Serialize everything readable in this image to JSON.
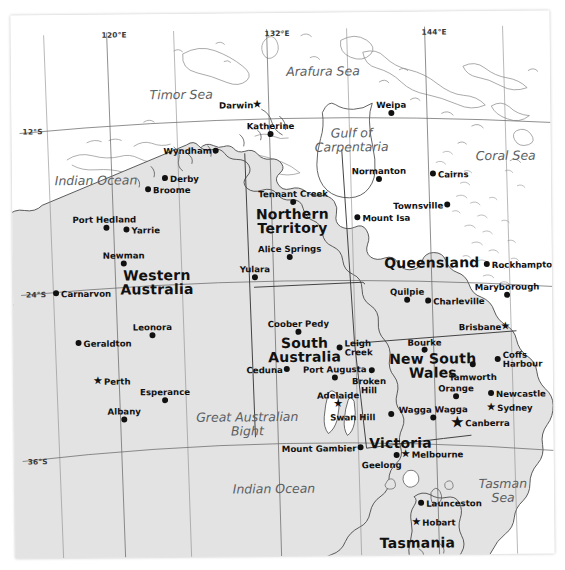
{
  "map": {
    "title": "Australia reference map",
    "projection_note": "tilted paper scan",
    "colors": {
      "land": "#e2e2e2",
      "land_stroke": "#4a4a4a",
      "ocean": "#ffffff",
      "graticule": "#5a5a5a",
      "border": "#333333",
      "label": "#111111",
      "water_label": "#5b5f63"
    },
    "graticule_labels": [
      {
        "name": "meridian-120E",
        "text": "120°E",
        "x": 104,
        "y": 30
      },
      {
        "name": "meridian-132E",
        "text": "132°E",
        "x": 267,
        "y": 30
      },
      {
        "name": "meridian-144E",
        "text": "144°E",
        "x": 424,
        "y": 30
      },
      {
        "name": "parallel-12S",
        "text": "12°S",
        "x": 24,
        "y": 126
      },
      {
        "name": "parallel-24S",
        "text": "24°S",
        "x": 26,
        "y": 289
      },
      {
        "name": "parallel-36S",
        "text": "36°S",
        "x": 26,
        "y": 456
      }
    ],
    "states": [
      {
        "name": "western-australia",
        "lines": [
          "Western",
          "Australia"
        ],
        "x": 156,
        "y": 271
      },
      {
        "name": "northern-territory",
        "lines": [
          "Northern",
          "Territory"
        ],
        "x": 292,
        "y": 211
      },
      {
        "name": "south-australia",
        "lines": [
          "South",
          "Australia"
        ],
        "x": 303,
        "y": 340
      },
      {
        "name": "queensland",
        "lines": [
          "Queensland"
        ],
        "x": 431,
        "y": 258
      },
      {
        "name": "new-south-wales",
        "lines": [
          "New South",
          "Wales"
        ],
        "x": 431,
        "y": 357
      },
      {
        "name": "victoria",
        "lines": [
          "Victoria"
        ],
        "x": 398,
        "y": 437
      },
      {
        "name": "tasmania",
        "lines": [
          "Tasmania"
        ],
        "x": 414,
        "y": 537
      }
    ],
    "water_bodies": [
      {
        "name": "timor-sea",
        "lines": [
          "Timor Sea"
        ],
        "x": 182,
        "y": 86,
        "size": "big"
      },
      {
        "name": "arafura-sea",
        "lines": [
          "Arafura Sea"
        ],
        "x": 324,
        "y": 64,
        "size": "big"
      },
      {
        "name": "gulf-of-carpentaria",
        "lines": [
          "Gulf of",
          "Carpentaria"
        ],
        "x": 352,
        "y": 125,
        "size": "big"
      },
      {
        "name": "coral-sea",
        "lines": [
          "Coral Sea"
        ],
        "x": 506,
        "y": 150,
        "size": "big"
      },
      {
        "name": "indian-ocean-north",
        "lines": [
          "Indian Ocean"
        ],
        "x": 96,
        "y": 171,
        "size": "big"
      },
      {
        "name": "great-australian-bight",
        "lines": [
          "Great Australian",
          "Bight"
        ],
        "x": 245,
        "y": 408,
        "size": "big"
      },
      {
        "name": "indian-ocean-south",
        "lines": [
          "Indian Ocean"
        ],
        "x": 271,
        "y": 481,
        "size": "big"
      },
      {
        "name": "tasman-sea",
        "lines": [
          "Tasman",
          "Sea"
        ],
        "x": 500,
        "y": 477,
        "size": "big"
      }
    ],
    "cities": [
      {
        "name": "darwin",
        "label": "Darwin",
        "marker": "star",
        "mx": 259,
        "my": 104,
        "lx": 255,
        "ly": 101,
        "anchor": "right"
      },
      {
        "name": "katherine",
        "label": "Katherine",
        "marker": "dot",
        "mx": 272,
        "my": 134,
        "lx": 272,
        "ly": 122,
        "anchor": "center"
      },
      {
        "name": "wyndham",
        "label": "Wyndham",
        "marker": "dot",
        "mx": 217,
        "my": 150,
        "lx": 213,
        "ly": 146,
        "anchor": "right"
      },
      {
        "name": "derby",
        "label": "Derby",
        "marker": "dot",
        "mx": 166,
        "my": 177,
        "lx": 171,
        "ly": 174,
        "anchor": "left"
      },
      {
        "name": "broome",
        "label": "Broome",
        "marker": "dot",
        "mx": 149,
        "my": 188,
        "lx": 154,
        "ly": 185,
        "anchor": "left"
      },
      {
        "name": "port-hedland",
        "label": "Port Hedland",
        "marker": "dot",
        "mx": 107,
        "my": 226,
        "lx": 105,
        "ly": 214,
        "anchor": "center"
      },
      {
        "name": "yarrie",
        "label": "Yarrie",
        "marker": "dot",
        "mx": 127,
        "my": 228,
        "lx": 132,
        "ly": 225,
        "anchor": "left"
      },
      {
        "name": "newman",
        "label": "Newman",
        "marker": "dot",
        "mx": 124,
        "my": 262,
        "lx": 124,
        "ly": 250,
        "anchor": "center"
      },
      {
        "name": "carnarvon",
        "label": "Carnarvon",
        "marker": "dot",
        "mx": 56,
        "my": 291,
        "lx": 61,
        "ly": 288,
        "anchor": "left"
      },
      {
        "name": "leonora",
        "label": "Leonora",
        "marker": "dot",
        "mx": 152,
        "my": 334,
        "lx": 152,
        "ly": 322,
        "anchor": "center"
      },
      {
        "name": "geraldton",
        "label": "Geraldton",
        "marker": "dot",
        "mx": 78,
        "my": 341,
        "lx": 83,
        "ly": 338,
        "anchor": "left"
      },
      {
        "name": "perth",
        "label": "Perth",
        "marker": "star",
        "mx": 97,
        "my": 379,
        "lx": 103,
        "ly": 376,
        "anchor": "left"
      },
      {
        "name": "esperance",
        "label": "Esperance",
        "marker": "dot",
        "mx": 164,
        "my": 399,
        "lx": 164,
        "ly": 387,
        "anchor": "center"
      },
      {
        "name": "albany",
        "label": "Albany",
        "marker": "dot",
        "mx": 123,
        "my": 418,
        "lx": 123,
        "ly": 406,
        "anchor": "center"
      },
      {
        "name": "weipa",
        "label": "Weipa",
        "marker": "dot",
        "mx": 393,
        "my": 114,
        "lx": 393,
        "ly": 102,
        "anchor": "center"
      },
      {
        "name": "normanton",
        "label": "Normanton",
        "marker": "dot",
        "mx": 380,
        "my": 180,
        "lx": 380,
        "ly": 168,
        "anchor": "center"
      },
      {
        "name": "cairns",
        "label": "Cairns",
        "marker": "dot",
        "mx": 434,
        "my": 175,
        "lx": 439,
        "ly": 172,
        "anchor": "left"
      },
      {
        "name": "townsville",
        "label": "Townsville",
        "marker": "dot",
        "mx": 448,
        "my": 206,
        "lx": 444,
        "ly": 203,
        "anchor": "right"
      },
      {
        "name": "mount-isa",
        "label": "Mount Isa",
        "marker": "dot",
        "mx": 358,
        "my": 218,
        "lx": 363,
        "ly": 215,
        "anchor": "left"
      },
      {
        "name": "tennant-creek",
        "label": "Tennant Creek",
        "marker": "dot",
        "mx": 294,
        "my": 202,
        "lx": 294,
        "ly": 190,
        "anchor": "center"
      },
      {
        "name": "alice-springs",
        "label": "Alice Springs",
        "marker": "dot",
        "mx": 290,
        "my": 257,
        "lx": 290,
        "ly": 245,
        "anchor": "center"
      },
      {
        "name": "yulara",
        "label": "Yulara",
        "marker": "dot",
        "mx": 255,
        "my": 277,
        "lx": 255,
        "ly": 265,
        "anchor": "center"
      },
      {
        "name": "rockhampton",
        "label": "Rockhampton",
        "marker": "dot",
        "mx": 487,
        "my": 266,
        "lx": 492,
        "ly": 263,
        "anchor": "left"
      },
      {
        "name": "quilpie",
        "label": "Quilpie",
        "marker": "dot",
        "mx": 407,
        "my": 301,
        "lx": 407,
        "ly": 289,
        "anchor": "center"
      },
      {
        "name": "charleville",
        "label": "Charleville",
        "marker": "dot",
        "mx": 428,
        "my": 302,
        "lx": 433,
        "ly": 299,
        "anchor": "left"
      },
      {
        "name": "maryborough",
        "label": "Maryborough",
        "marker": "dot",
        "mx": 507,
        "my": 297,
        "lx": 507,
        "ly": 285,
        "anchor": "center"
      },
      {
        "name": "coober-pedy",
        "label": "Coober Pedy",
        "marker": "dot",
        "mx": 298,
        "my": 332,
        "lx": 298,
        "ly": 320,
        "anchor": "center"
      },
      {
        "name": "leigh-creek",
        "label": "Leigh Creek",
        "marker": "dot",
        "mx": 339,
        "my": 348,
        "lx": 344,
        "ly": 340,
        "anchor": "left",
        "two_line": true
      },
      {
        "name": "brisbane",
        "label": "Brisbane",
        "marker": "star",
        "mx": 505,
        "my": 328,
        "lx": 501,
        "ly": 325,
        "anchor": "right"
      },
      {
        "name": "bourke",
        "label": "Bourke",
        "marker": "dot",
        "mx": 424,
        "my": 351,
        "lx": 424,
        "ly": 340,
        "anchor": "center"
      },
      {
        "name": "ceduna",
        "label": "Ceduna",
        "marker": "dot",
        "mx": 286,
        "my": 369,
        "lx": 282,
        "ly": 366,
        "anchor": "right"
      },
      {
        "name": "port-augusta",
        "label": "Port Augusta",
        "marker": "dot",
        "mx": 334,
        "my": 378,
        "lx": 334,
        "ly": 366,
        "anchor": "center"
      },
      {
        "name": "coffs-harbour",
        "label": "Coffs Harbour",
        "marker": "dot",
        "mx": 497,
        "my": 361,
        "lx": 502,
        "ly": 353,
        "anchor": "left",
        "two_line": true
      },
      {
        "name": "broken-hill",
        "label": "Broken Hill",
        "marker": "dot",
        "mx": 371,
        "my": 371,
        "lx": 368,
        "ly": 378,
        "anchor": "center",
        "two_line": true
      },
      {
        "name": "tamworth",
        "label": "Tamworth",
        "marker": "dot",
        "mx": 472,
        "my": 366,
        "lx": 472,
        "ly": 375,
        "anchor": "center"
      },
      {
        "name": "orange",
        "label": "Orange",
        "marker": "dot",
        "mx": 455,
        "my": 398,
        "lx": 455,
        "ly": 386,
        "anchor": "center"
      },
      {
        "name": "newcastle",
        "label": "Newcastle",
        "marker": "dot",
        "mx": 490,
        "my": 395,
        "lx": 495,
        "ly": 392,
        "anchor": "left"
      },
      {
        "name": "adelaide",
        "label": "Adelaide",
        "marker": "star",
        "mx": 337,
        "my": 404,
        "lx": 337,
        "ly": 392,
        "anchor": "center"
      },
      {
        "name": "sydney",
        "label": "Sydney",
        "marker": "star",
        "mx": 490,
        "my": 409,
        "lx": 496,
        "ly": 406,
        "anchor": "left"
      },
      {
        "name": "wagga-wagga",
        "label": "Wagga Wagga",
        "marker": "dot",
        "mx": 432,
        "my": 419,
        "lx": 432,
        "ly": 407,
        "anchor": "center"
      },
      {
        "name": "swan-hill",
        "label": "Swan Hill",
        "marker": "dot",
        "mx": 390,
        "my": 415,
        "lx": 329,
        "ly": 414,
        "anchor": "left"
      },
      {
        "name": "canberra",
        "label": "Canberra",
        "marker": "capital",
        "mx": 456,
        "my": 424,
        "lx": 464,
        "ly": 421,
        "anchor": "left"
      },
      {
        "name": "mount-gambier",
        "label": "Mount Gambier",
        "marker": "dot",
        "mx": 359,
        "my": 448,
        "lx": 355,
        "ly": 445,
        "anchor": "right"
      },
      {
        "name": "melbourne",
        "label": "Melbourne",
        "marker": "star",
        "mx": 404,
        "my": 455,
        "lx": 410,
        "ly": 452,
        "anchor": "left"
      },
      {
        "name": "geelong",
        "label": "Geelong",
        "marker": "dot",
        "mx": 395,
        "my": 456,
        "lx": 380,
        "ly": 462,
        "anchor": "center"
      },
      {
        "name": "launceston",
        "label": "Launceston",
        "marker": "dot",
        "mx": 419,
        "my": 504,
        "lx": 424,
        "ly": 501,
        "anchor": "left"
      },
      {
        "name": "hobart",
        "label": "Hobart",
        "marker": "star",
        "mx": 414,
        "my": 523,
        "lx": 420,
        "ly": 520,
        "anchor": "left"
      }
    ]
  }
}
